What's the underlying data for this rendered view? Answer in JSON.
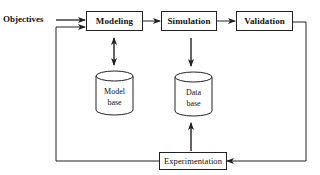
{
  "diagram": {
    "input_label": "Objectives",
    "process_boxes": {
      "modeling": "Modeling",
      "simulation": "Simulation",
      "validation": "Validation",
      "experimentation": "Experimentation"
    },
    "storage": {
      "model_base": {
        "line1": "Model",
        "line2": "base"
      },
      "data_base": {
        "line1": "Data",
        "line2": "base"
      }
    },
    "edges": [
      {
        "from": "Objectives",
        "to": "Modeling",
        "type": "arrow"
      },
      {
        "from": "Modeling",
        "to": "Simulation",
        "type": "arrow"
      },
      {
        "from": "Simulation",
        "to": "Validation",
        "type": "arrow"
      },
      {
        "from": "Validation",
        "to": "Experimentation",
        "type": "arrow"
      },
      {
        "from": "Experimentation",
        "to": "Modeling",
        "type": "arrow"
      },
      {
        "from": "Modeling",
        "to": "Model base",
        "type": "bidirectional"
      },
      {
        "from": "Simulation",
        "to": "Data base",
        "type": "arrow"
      },
      {
        "from": "Experimentation",
        "to": "Data base",
        "type": "arrow"
      }
    ],
    "colors": {
      "line": "#222222",
      "background": "#ffffff",
      "text": "#111111"
    }
  }
}
